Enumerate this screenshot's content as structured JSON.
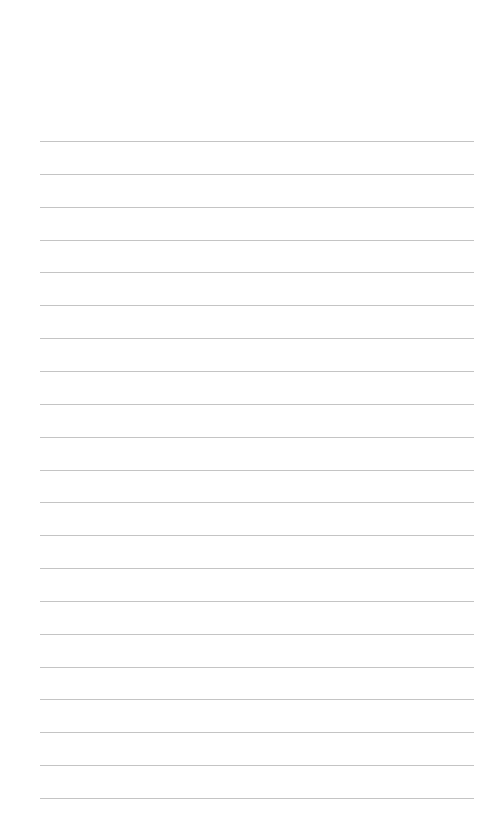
{
  "page": {
    "type": "lined-paper",
    "background_color": "#ffffff",
    "line_color": "#c4c4c4",
    "ruled_lines": {
      "count": 21,
      "first_y": 141,
      "spacing": 32.85,
      "left_x": 40,
      "right_x": 474
    }
  }
}
